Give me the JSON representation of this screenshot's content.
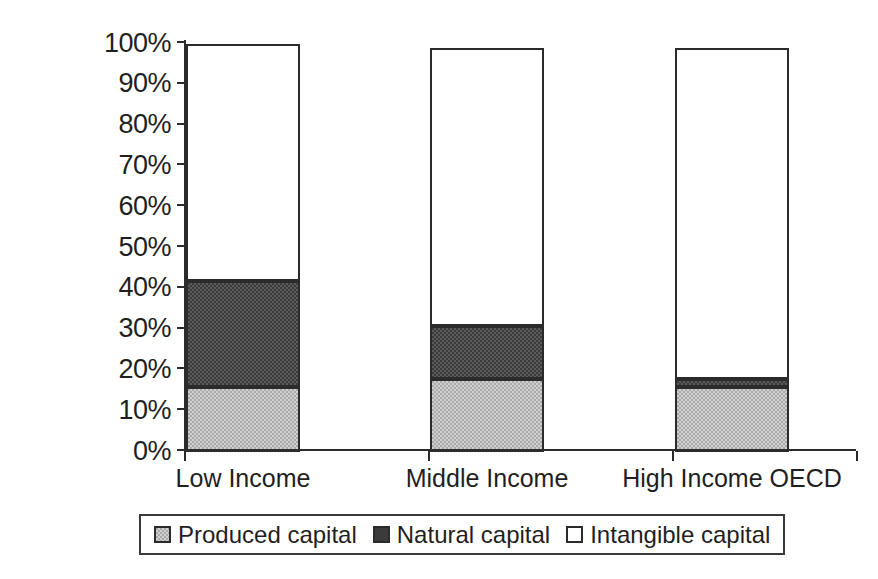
{
  "chart_data": {
    "type": "bar",
    "stacked": true,
    "normalized_percent": true,
    "title": "",
    "subtitle": "",
    "xlabel": "",
    "ylabel": "",
    "categories": [
      "Low Income",
      "Middle Income",
      "High Income OECD"
    ],
    "series": [
      {
        "name": "Produced capital",
        "color": "#a9a9a9",
        "values": [
          16,
          18,
          16
        ]
      },
      {
        "name": "Natural capital",
        "color": "#3b3b3b",
        "values": [
          26,
          13,
          2
        ]
      },
      {
        "name": "Intangible capital",
        "color": "#ffffff",
        "values": [
          58,
          68,
          81
        ]
      }
    ],
    "cumulative_tops_percent": [
      {
        "category": "Low Income",
        "produced_top": 16,
        "natural_top": 42,
        "intangible_top": 100
      },
      {
        "category": "Middle Income",
        "produced_top": 18,
        "natural_top": 31,
        "intangible_top": 100
      },
      {
        "category": "High Income OECD",
        "produced_top": 16,
        "natural_top": 18,
        "intangible_top": 100
      }
    ],
    "ylim": [
      0,
      100
    ],
    "ytick_step": 10,
    "ytick_labels": [
      "100%",
      "90%",
      "80%",
      "70%",
      "60%",
      "50%",
      "40%",
      "30%",
      "20%",
      "10%",
      "0%"
    ],
    "ytick_values": [
      100,
      90,
      80,
      70,
      60,
      50,
      40,
      30,
      20,
      10,
      0
    ],
    "grid": false,
    "legend_position": "bottom",
    "legend_entries": [
      "Produced capital",
      "Natural capital",
      "Intangible capital"
    ]
  },
  "legend": {
    "items": [
      {
        "label": "Produced capital",
        "swatch": "produced"
      },
      {
        "label": "Natural capital",
        "swatch": "natural"
      },
      {
        "label": "Intangible capital",
        "swatch": "intangible"
      }
    ]
  }
}
